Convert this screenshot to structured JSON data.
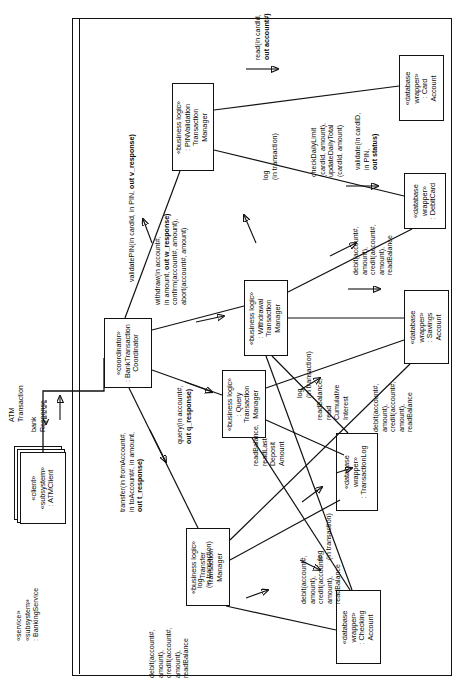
{
  "diagram": {
    "type": "uml-communication-diagram",
    "orientation": "rotated-90-ccw",
    "accent": "#111111",
    "background": "#ffffff"
  },
  "outer_subsystem": {
    "stereotype1": "«service»",
    "stereotype2": "«subsystem»",
    "name": ": BankingService"
  },
  "actors": {
    "atm_client": {
      "stereotype1": "«client»",
      "stereotype2": "«subsystem»",
      "name": ": ATMClient"
    }
  },
  "objects": [
    {
      "id": "coordinator",
      "stereotype": "«coordinator»",
      "name_line1": ": BankTransaction",
      "name_line2": "Coordinator"
    },
    {
      "id": "pin-validation",
      "stereotype": "«business logic»",
      "name_line1": ": PINValidation",
      "name_line2": "Transaction",
      "name_line3": "Manager"
    },
    {
      "id": "withdrawal",
      "stereotype": "«business logic»",
      "name_line1": ": Withdrawal",
      "name_line2": "Transaction",
      "name_line3": "Manager"
    },
    {
      "id": "query",
      "stereotype": "«business logic»",
      "name_line1": ": Query",
      "name_line2": "Transaction",
      "name_line3": "Manager"
    },
    {
      "id": "transfer",
      "stereotype": "«business logic»",
      "name_line1": ": Transfer",
      "name_line2": "Transaction",
      "name_line3": "Manager"
    },
    {
      "id": "card-account",
      "stereotype": "«database",
      "stereotype2": "wrapper»",
      "name_line1": ": Card",
      "name_line2": "Account"
    },
    {
      "id": "debit-card",
      "stereotype": "«database",
      "stereotype2": "wrapper»",
      "name_line1": ": DebitCard"
    },
    {
      "id": "savings-account",
      "stereotype": "«database",
      "stereotype2": "wrapper»",
      "name_line1": ": Savings",
      "name_line2": "Account"
    },
    {
      "id": "transaction-log",
      "stereotype": "«database",
      "stereotype2": "wrapper»",
      "name_line1": ": TransactionLog"
    },
    {
      "id": "checking-account",
      "stereotype": "«database",
      "stereotype2": "wrapper»",
      "name_line1": ": Checking",
      "name_line2": "Account"
    }
  ],
  "messages": {
    "atm_transaction": "ATM\nTransaction",
    "bank_response": "bank\nResponse",
    "validate_pin": "validatePIN(in cardId, in PIN, out v_response)",
    "withdraw": "withdraw(in account#,\nin amount, out w_response),\nconfirm(account#, amount),\nabort(account#, amount)",
    "query": "query(in account#,\nout q_response)",
    "transfer": "transfer(in fromAccount#,\nin toAccount#, in amount,\nout t_response)",
    "read_card": "read(in cardId,\nout account#)",
    "validate_card": "validate(in cardID,\nin PIN,\nout status)",
    "check_daily_limit": "checkDailyLimit\n(cardId, amount),\nupdateDailyTotal\n(cardId, amount)",
    "log_in_transaction": "log\n(in transaction)",
    "debit_credit_read": "debit(account#,\namount),\ncredit(account#,\namount),\nreadBalance",
    "read_balance_cumulative": "readBalance,\nread\nCumulative\nInterest",
    "read_balance_last_deposit": "readBalance,\nreadLast\nDeposit\nAmount"
  },
  "message_labels": {
    "validate_pin": {
      "plain1": "validatePIN(in cardId, in PIN, ",
      "bold": "out v_response)"
    },
    "withdraw": {
      "l1": "withdraw(in account#,",
      "l2_plain": "in amount, ",
      "l2_bold": "out w_response)",
      "l3": "confirm(account#, amount),",
      "l4": "abort(account#, amount)"
    },
    "query": {
      "l1": "query(in account#,",
      "l2_bold": "out q_response)"
    },
    "transfer": {
      "l1": "transfer(in fromAccount#,",
      "l2": "in toAccount#, in amount,",
      "l3_bold": "out t_response)"
    },
    "read_card": {
      "l1": "read(in cardId,",
      "l2_bold": "out account#)"
    },
    "validate_card": {
      "l1": "validate(in cardID,",
      "l2": "in PIN,",
      "l3_bold": "out status)"
    },
    "check_daily": {
      "l1": "checkDailyLimit",
      "l2": "(cardId, amount),",
      "l3": "updateDailyTotal",
      "l4": "(cardId, amount)"
    },
    "log": {
      "l1": "log",
      "l2": "(in transaction)"
    },
    "debit_credit": {
      "l1": "debit(account#,",
      "l2": "amount),",
      "l3": "credit(account#,",
      "l4": "amount),",
      "l5": "readBalance"
    },
    "read_cumulative": {
      "l1": "readBalance,",
      "l2": "read",
      "l3": "Cumulative",
      "l4": "Interest"
    },
    "read_last_deposit": {
      "l1": "readBalance,",
      "l2": "readLast",
      "l3": "Deposit",
      "l4": "Amount"
    },
    "atm_transaction": {
      "l1": "ATM",
      "l2": "Transaction"
    },
    "bank_response": {
      "l1": "bank",
      "l2": "Response"
    }
  }
}
